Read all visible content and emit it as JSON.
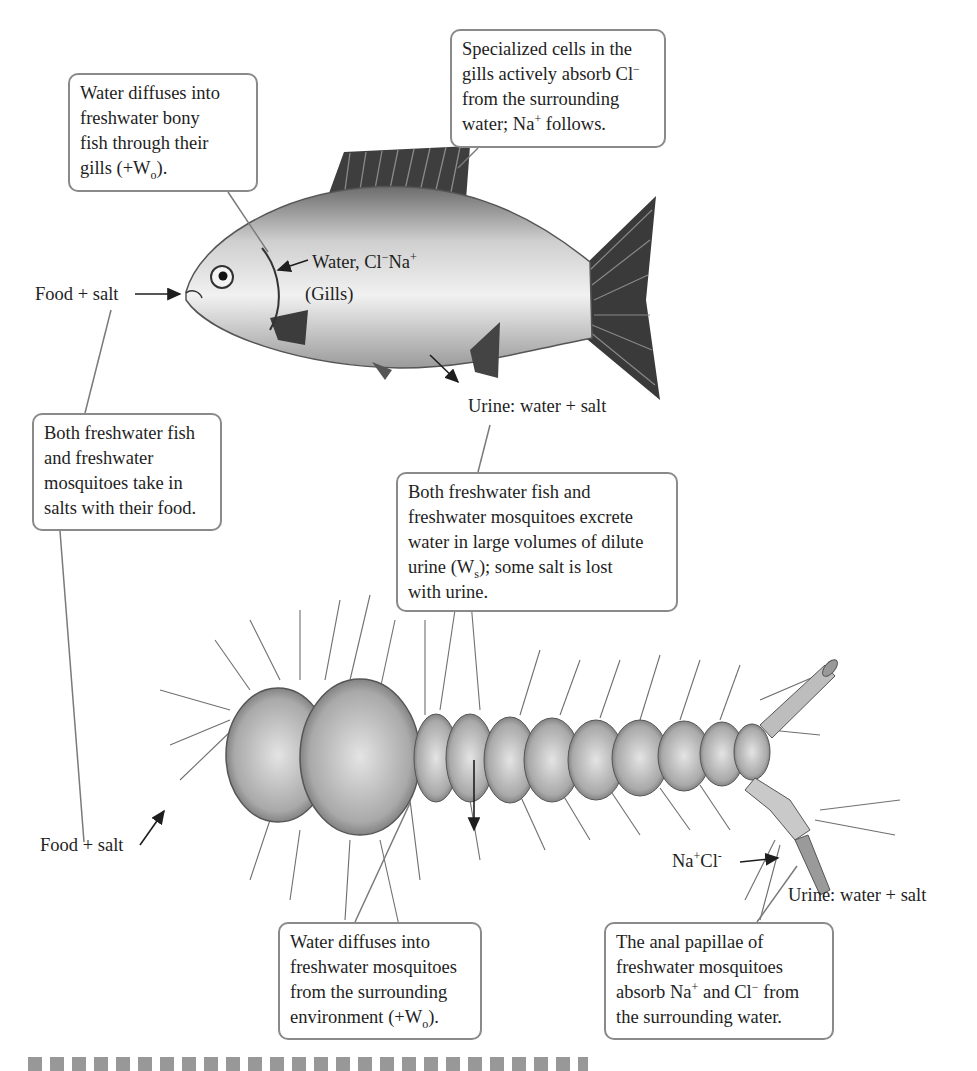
{
  "diagram": {
    "boxes": {
      "fish_gills_water": {
        "line1": "Water diffuses into",
        "line2": "freshwater bony",
        "line3": "fish through their",
        "line4_pre": "gills (+W",
        "line4_sub": "o",
        "line4_post": ")."
      },
      "gill_cells": {
        "line1": "Specialized cells in the",
        "line2_pre": "gills actively absorb Cl",
        "line2_sup": "−",
        "line3": "from the surrounding",
        "line4_pre": "water; Na",
        "line4_sup": "+",
        "line4_post": " follows."
      },
      "food_salts": {
        "line1": "Both freshwater fish",
        "line2": "and freshwater",
        "line3": "mosquitoes take in",
        "line4": "salts with their food."
      },
      "urine_excrete": {
        "line1": "Both freshwater fish and",
        "line2": "freshwater mosquitoes excrete",
        "line3": "water in large volumes of dilute",
        "line4_pre": "urine (W",
        "line4_sub": "s",
        "line4_post": "); some salt is lost",
        "line5": "with urine."
      },
      "mosquito_water": {
        "line1": "Water diffuses into",
        "line2": "freshwater mosquitoes",
        "line3": "from the surrounding",
        "line4_pre": "environment (+W",
        "line4_sub": "o",
        "line4_post": ")."
      },
      "anal_papillae": {
        "line1": "The anal papillae of",
        "line2": "freshwater mosquitoes",
        "line3_a": "absorb Na",
        "line3_sup1": "+",
        "line3_b": " and Cl",
        "line3_sup2": "−",
        "line3_c": " from",
        "line4": "the surrounding water."
      }
    },
    "labels": {
      "fish_food": "Food + salt",
      "fish_gill_pre": "Water, Cl",
      "fish_gill_sup1": "−",
      "fish_gill_mid": "Na",
      "fish_gill_sup2": "+",
      "fish_gills": "(Gills)",
      "fish_urine": "Urine: water + salt",
      "mosq_food": "Food + salt",
      "mosq_ion_a": "Na",
      "mosq_ion_sup1": "+",
      "mosq_ion_b": "Cl",
      "mosq_ion_sup2": "-",
      "mosq_urine": "Urine: water + salt"
    },
    "colors": {
      "box_border": "#8a8a8a",
      "leader_line": "#7a7a7a",
      "art_dark": "#3a3a3a"
    }
  }
}
